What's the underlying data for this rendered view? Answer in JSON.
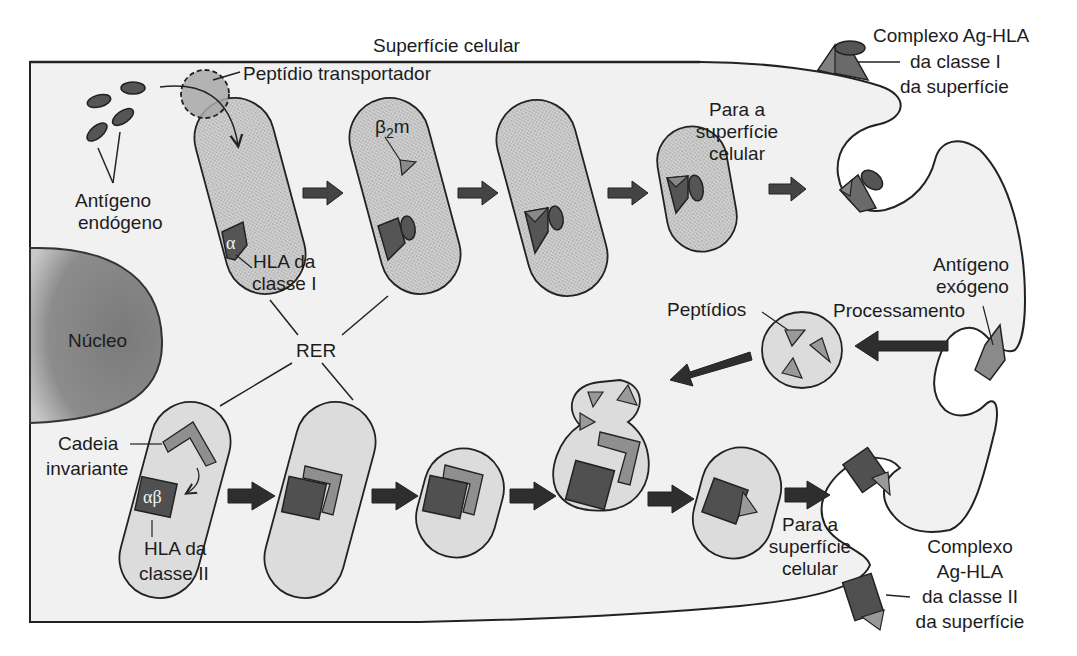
{
  "diagram": {
    "colors": {
      "cytoplasm": "#f2f2f2",
      "membrane": "#222222",
      "rer_stippled": "#c9c9c9",
      "vesicle": "#dcdcdc",
      "nucleus": "#8a8a8a",
      "hla_dark": "#555555",
      "peptide_light": "#9a9a9a",
      "arrow_dark": "#3a3a3a"
    },
    "labels": {
      "cell_surface": "Superfície celular",
      "transporter_peptide": "Peptídio transportador",
      "endogenous_antigen_1": "Antígeno",
      "endogenous_antigen_2": "endógeno",
      "beta2m_beta": "β",
      "beta2m_sub": "2",
      "beta2m_m": "m",
      "alpha": "α",
      "hla_class1_1": "HLA da",
      "hla_class1_2": "classe I",
      "nucleus": "Núcleo",
      "rer": "RER",
      "to_surface_top_1": "Para a",
      "to_surface_top_2": "superfície",
      "to_surface_top_3": "celular",
      "complex_class1_1": "Complexo Ag-HLA",
      "complex_class1_2": "da classe I",
      "complex_class1_3": "da superfície",
      "exogenous_antigen_1": "Antígeno",
      "exogenous_antigen_2": "exógeno",
      "processing": "Processamento",
      "peptides": "Peptídios",
      "invariant_chain_1": "Cadeia",
      "invariant_chain_2": "invariante",
      "alphabeta": "αβ",
      "hla_class2_1": "HLA da",
      "hla_class2_2": "classe II",
      "to_surface_bottom_1": "Para a",
      "to_surface_bottom_2": "superfície",
      "to_surface_bottom_3": "celular",
      "complex_class2_1": "Complexo",
      "complex_class2_2": "Ag-HLA",
      "complex_class2_3": "da classe II",
      "complex_class2_4": "da superfície"
    },
    "pathways": [
      {
        "name": "class-I",
        "steps": 5,
        "direction": "left-to-right"
      },
      {
        "name": "exogenous-processing",
        "steps": 3,
        "direction": "right-to-left"
      },
      {
        "name": "class-II",
        "steps": 6,
        "direction": "left-to-right"
      }
    ]
  }
}
